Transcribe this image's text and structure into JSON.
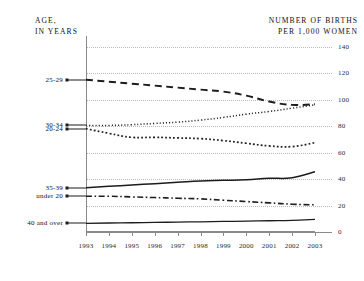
{
  "headers": {
    "left": "AGE,\nIN YEARS",
    "right": "NUMBER OF BIRTHS\nPER 1,000 WOMEN"
  },
  "chart_data": {
    "type": "line",
    "title": "",
    "subtitle": "",
    "xlabel": "",
    "ylabel": "NUMBER OF BIRTHS PER 1,000 WOMEN",
    "grouplabel": "AGE, IN YEARS",
    "x": [
      1993,
      1994,
      1995,
      1996,
      1997,
      1998,
      1999,
      2000,
      2001,
      2002,
      2003
    ],
    "xtick_labels": [
      "1993",
      "1994",
      "1995",
      "1996",
      "1997",
      "1998",
      "1999",
      "2000",
      "2001",
      "2002",
      "2003"
    ],
    "ytick_labels": [
      "0",
      "20",
      "40",
      "60",
      "80",
      "100",
      "120",
      "140"
    ],
    "yticks": [
      0,
      20,
      40,
      60,
      80,
      100,
      120,
      140
    ],
    "ylim": [
      0,
      148
    ],
    "xlim": [
      1993,
      2003
    ],
    "grid": "horizontal-dotted",
    "legend": "inline-left-labels",
    "series": [
      {
        "name": "25-29",
        "label": "25-29",
        "style": "dashed",
        "values": [
          115.0,
          113.5,
          112.0,
          110.5,
          109.0,
          107.5,
          106.0,
          103.0,
          98.5,
          96.0,
          96.5
        ]
      },
      {
        "name": "30-34",
        "label": "30-34",
        "style": "fine-dotted",
        "values": [
          80.5,
          80.5,
          81.0,
          82.0,
          83.0,
          84.5,
          86.5,
          89.0,
          91.0,
          93.5,
          96.0
        ]
      },
      {
        "name": "20-24",
        "label": "20-24",
        "style": "dotted",
        "values": [
          78.0,
          74.5,
          71.5,
          71.5,
          71.0,
          70.5,
          69.0,
          67.0,
          65.0,
          64.5,
          67.5
        ]
      },
      {
        "name": "35-39",
        "label": "35-39",
        "style": "solid",
        "values": [
          33.5,
          34.5,
          35.5,
          36.5,
          37.5,
          38.5,
          39.0,
          39.5,
          40.5,
          41.0,
          45.5
        ]
      },
      {
        "name": "under 20",
        "label": "under 20",
        "style": "dash-dot",
        "values": [
          27.0,
          27.0,
          26.5,
          26.0,
          25.5,
          25.0,
          24.0,
          23.0,
          22.0,
          21.0,
          20.5
        ]
      },
      {
        "name": "40 and over",
        "label": "40 and over",
        "style": "solid-thin",
        "values": [
          6.5,
          6.8,
          7.0,
          7.2,
          7.5,
          7.7,
          8.0,
          8.2,
          8.5,
          8.8,
          9.5
        ]
      }
    ]
  }
}
